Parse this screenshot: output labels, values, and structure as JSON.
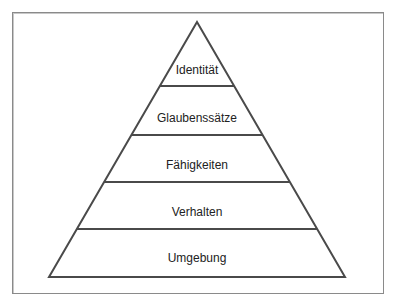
{
  "diagram": {
    "type": "pyramid",
    "levels_top_to_bottom": [
      {
        "label": "Identität"
      },
      {
        "label": "Glaubenssätze"
      },
      {
        "label": "Fähigkeiten"
      },
      {
        "label": "Verhalten"
      },
      {
        "label": "Umgebung"
      }
    ],
    "colors": {
      "line": "#4a4a4a",
      "frame": "#8a8a8a",
      "text": "#222222",
      "background": "#ffffff"
    }
  }
}
